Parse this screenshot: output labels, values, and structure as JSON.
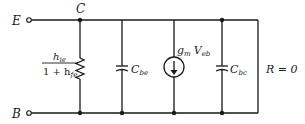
{
  "diagram": {
    "type": "small-signal equivalent circuit",
    "terminals": {
      "emitter": "E",
      "collector": "C",
      "base": "B"
    },
    "components": {
      "resistor": {
        "num": "h",
        "num_sub": "ie",
        "den_pre": "1 + h",
        "den_sub": "fe"
      },
      "cap_be": {
        "main": "C",
        "sub": "be"
      },
      "current_source": {
        "g": "g",
        "g_sub": "m",
        "v": "V",
        "v_sub": "eb"
      },
      "cap_bc": {
        "main": "C",
        "sub": "bc"
      },
      "load": "R = 0"
    },
    "colors": {
      "line": "#1a1a1a",
      "background": "#ffffff"
    }
  }
}
